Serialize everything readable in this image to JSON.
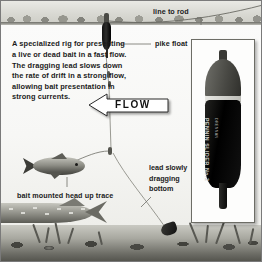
{
  "diagram": {
    "intro_text": "A specialized rig for presenting a live or dead bait in a fast flow. The dragging lead slows down the rate of drift in a strong flow, allowing bait presentation in strong currents.",
    "flow_label": "FLOW",
    "labels": {
      "line_to_rod": "line to rod",
      "pike_float": "pike float",
      "lead_slowly": "lead slowly",
      "dragging": "dragging",
      "bottom": "bottom",
      "bait_trace": "bait mounted head up trace"
    },
    "inset": {
      "product_name": "PENNIN SLIDER No.2",
      "product_brand": "DRENNAN"
    },
    "colors": {
      "water": "#f7f7f5",
      "bed": "#4e4e48",
      "float_body": "#000000",
      "text": "#1b1b1b",
      "border": "#7a7a7a"
    }
  }
}
